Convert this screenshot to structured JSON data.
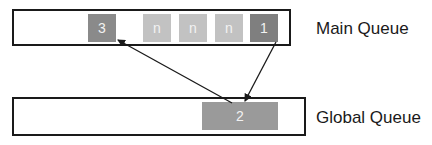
{
  "diagram": {
    "main_queue": {
      "label": "Main Queue",
      "items": [
        {
          "text": "3",
          "color": "#8a8a8a"
        },
        {
          "text": "n",
          "color": "#c2c2c2"
        },
        {
          "text": "n",
          "color": "#c2c2c2"
        },
        {
          "text": "n",
          "color": "#c2c2c2"
        },
        {
          "text": "1",
          "color": "#7f7f7f"
        }
      ]
    },
    "global_queue": {
      "label": "Global Queue",
      "items": [
        {
          "text": "2",
          "color": "#9a9a9a"
        }
      ]
    },
    "arrows": [
      {
        "from": "1",
        "to": "2"
      },
      {
        "from": "2",
        "to": "3"
      }
    ]
  }
}
